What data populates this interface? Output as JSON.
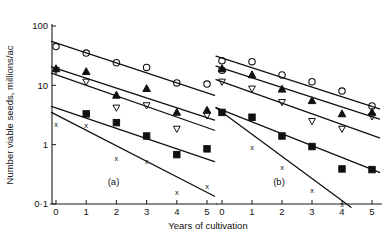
{
  "chart_data": {
    "type": "scatter",
    "title": "",
    "xlabel": "Years of cultivation",
    "ylabel": "Number viable seeds, millions/ac",
    "yscale": "log",
    "ylim": [
      0.1,
      100
    ],
    "xlim": [
      0,
      5
    ],
    "y_tick_labels": [
      "100",
      "10",
      "1",
      "0·1"
    ],
    "y_tick_values": [
      100,
      10,
      1,
      0.1
    ],
    "x_tick_labels": [
      "0",
      "1",
      "2",
      "3",
      "4",
      "5"
    ],
    "x_tick_values": [
      0,
      1,
      2,
      3,
      4,
      5
    ],
    "grid": false,
    "legend": "none",
    "panels": [
      {
        "label": "(a)",
        "series": [
          {
            "name": "series-circle",
            "marker": "open-circle",
            "x": [
              0,
              1,
              2,
              3,
              4,
              5
            ],
            "values": [
              45,
              35,
              24,
              20,
              11,
              10.5
            ],
            "fit": {
              "x": [
                -0.15,
                5.25
              ],
              "y": [
                55,
                6.8
              ]
            }
          },
          {
            "name": "series-triangle",
            "marker": "filled-triangle",
            "x": [
              0,
              1,
              2,
              3,
              4,
              5
            ],
            "values": [
              19,
              17,
              6.8,
              8.8,
              3.5,
              3.8
            ],
            "fit": {
              "x": [
                -0.15,
                5.25
              ],
              "y": [
                20.5,
                2.6
              ]
            }
          },
          {
            "name": "series-inverted-triangle",
            "marker": "open-inverted-triangle",
            "x": [
              0,
              1,
              2,
              3,
              4,
              5
            ],
            "values": [
              18,
              11.5,
              4.2,
              4.6,
              1.85,
              3.1
            ],
            "fit": {
              "x": [
                -0.15,
                5.25
              ],
              "y": [
                16.0,
                1.75
              ]
            }
          },
          {
            "name": "series-square",
            "marker": "filled-square",
            "x": [
              1,
              2,
              3,
              4,
              5
            ],
            "values": [
              3.3,
              2.35,
              1.4,
              0.68,
              0.85
            ],
            "fit": {
              "x": [
                -0.15,
                5.25
              ],
              "y": [
                4.4,
                0.52
              ]
            }
          },
          {
            "name": "series-cross",
            "marker": "x",
            "x": [
              0,
              1,
              2,
              3,
              4,
              5
            ],
            "values": [
              2.2,
              2.1,
              0.6,
              0.52,
              0.155,
              0.2
            ],
            "fit": {
              "x": [
                -0.15,
                5.25
              ],
              "y": [
                3.5,
                0.135
              ]
            }
          }
        ]
      },
      {
        "label": "(b)",
        "series": [
          {
            "name": "series-circle",
            "marker": "open-circle",
            "x": [
              0,
              0,
              1,
              2,
              3,
              4,
              5
            ],
            "values": [
              26,
              18,
              25,
              15,
              11.5,
              8,
              4.5
            ],
            "fit": {
              "x": [
                -0.2,
                5.25
              ],
              "y": [
                31,
                4.0
              ]
            }
          },
          {
            "name": "series-triangle",
            "marker": "filled-triangle",
            "x": [
              0,
              1,
              2,
              3,
              4,
              5
            ],
            "values": [
              19,
              15,
              8.6,
              5.5,
              3.3,
              3.5
            ],
            "fit": {
              "x": [
                -0.2,
                5.25
              ],
              "y": [
                21,
                2.7
              ]
            }
          },
          {
            "name": "series-inverted-triangle",
            "marker": "open-inverted-triangle",
            "x": [
              0,
              1,
              2,
              3,
              4,
              5
            ],
            "values": [
              11.5,
              8.8,
              5.2,
              2.5,
              1.85,
              3.0
            ],
            "fit": {
              "x": [
                -0.2,
                5.25
              ],
              "y": [
                12.5,
                1.3
              ]
            }
          },
          {
            "name": "series-square",
            "marker": "filled-square",
            "x": [
              0,
              1,
              2,
              3,
              4,
              5
            ],
            "values": [
              3.5,
              2.9,
              1.4,
              0.93,
              0.39,
              0.38
            ],
            "fit": {
              "x": [
                -0.2,
                5.25
              ],
              "y": [
                4.2,
                0.34
              ]
            }
          },
          {
            "name": "series-cross",
            "marker": "x",
            "x": [
              0,
              1,
              2,
              3,
              4
            ],
            "values": [
              3.4,
              0.9,
              0.42,
              0.17,
              0.1
            ],
            "fit": {
              "x": [
                -0.2,
                4.3
              ],
              "y": [
                4.2,
                0.088
              ]
            }
          }
        ]
      }
    ]
  }
}
